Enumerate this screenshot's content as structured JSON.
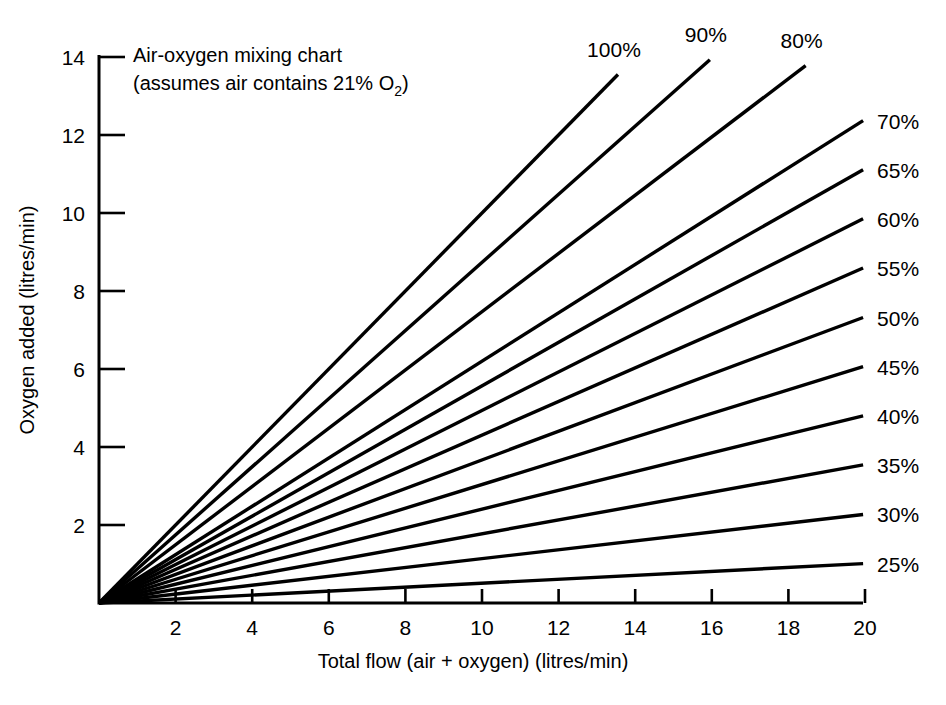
{
  "chart_data": {
    "type": "line",
    "title": "Air-oxygen mixing chart",
    "subtitle_prefix": "(assumes air contains 21% O",
    "subtitle_sub": "2",
    "subtitle_suffix": ")",
    "xlabel": "Total flow (air + oxygen) (litres/min)",
    "ylabel": "Oxygen added (litres/min)",
    "xlim": [
      0,
      20
    ],
    "ylim": [
      0,
      14
    ],
    "xticks": [
      2,
      4,
      6,
      8,
      10,
      12,
      14,
      16,
      18,
      20
    ],
    "yticks": [
      2,
      4,
      6,
      8,
      10,
      12,
      14
    ],
    "xtick_labels": [
      "2",
      "4",
      "6",
      "8",
      "10",
      "12",
      "14",
      "16",
      "18",
      "20"
    ],
    "ytick_labels": [
      "2",
      "4",
      "6",
      "8",
      "10",
      "12",
      "14"
    ],
    "grid": false,
    "legend_position": "inline-right-end-of-line",
    "line_color": "#000000",
    "background_color": "#ffffff",
    "series": [
      {
        "name": "100%",
        "label": "100%",
        "fio2_percent": 100,
        "slope": 1.0,
        "x_start": 0,
        "y_start": 0,
        "x_end": 13.55,
        "y_end": 13.55,
        "label_anchor": "above"
      },
      {
        "name": "90%",
        "label": "90%",
        "fio2_percent": 90,
        "slope": 0.8734,
        "x_start": 0,
        "y_start": 0,
        "x_end": 15.95,
        "y_end": 13.93,
        "label_anchor": "above"
      },
      {
        "name": "80%",
        "label": "80%",
        "fio2_percent": 80,
        "slope": 0.7468,
        "x_start": 0,
        "y_start": 0,
        "x_end": 18.45,
        "y_end": 13.78,
        "label_anchor": "above"
      },
      {
        "name": "70%",
        "label": "70%",
        "fio2_percent": 70,
        "slope": 0.6203,
        "x_start": 0,
        "y_start": 0,
        "x_end": 19.95,
        "y_end": 12.37,
        "label_anchor": "right"
      },
      {
        "name": "65%",
        "label": "65%",
        "fio2_percent": 65,
        "slope": 0.557,
        "x_start": 0,
        "y_start": 0,
        "x_end": 19.95,
        "y_end": 11.11,
        "label_anchor": "right"
      },
      {
        "name": "60%",
        "label": "60%",
        "fio2_percent": 60,
        "slope": 0.4937,
        "x_start": 0,
        "y_start": 0,
        "x_end": 19.95,
        "y_end": 9.85,
        "label_anchor": "right"
      },
      {
        "name": "55%",
        "label": "55%",
        "fio2_percent": 55,
        "slope": 0.4304,
        "x_start": 0,
        "y_start": 0,
        "x_end": 19.95,
        "y_end": 8.59,
        "label_anchor": "right"
      },
      {
        "name": "50%",
        "label": "50%",
        "fio2_percent": 50,
        "slope": 0.3671,
        "x_start": 0,
        "y_start": 0,
        "x_end": 19.95,
        "y_end": 7.32,
        "label_anchor": "right"
      },
      {
        "name": "45%",
        "label": "45%",
        "fio2_percent": 45,
        "slope": 0.3038,
        "x_start": 0,
        "y_start": 0,
        "x_end": 19.95,
        "y_end": 6.06,
        "label_anchor": "right"
      },
      {
        "name": "40%",
        "label": "40%",
        "fio2_percent": 40,
        "slope": 0.2405,
        "x_start": 0,
        "y_start": 0,
        "x_end": 19.95,
        "y_end": 4.8,
        "label_anchor": "right"
      },
      {
        "name": "35%",
        "label": "35%",
        "fio2_percent": 35,
        "slope": 0.1772,
        "x_start": 0,
        "y_start": 0,
        "x_end": 19.95,
        "y_end": 3.54,
        "label_anchor": "right"
      },
      {
        "name": "30%",
        "label": "30%",
        "fio2_percent": 30,
        "slope": 0.1139,
        "x_start": 0,
        "y_start": 0,
        "x_end": 19.95,
        "y_end": 2.27,
        "label_anchor": "right"
      },
      {
        "name": "25%",
        "label": "25%",
        "fio2_percent": 25,
        "slope": 0.0506,
        "x_start": 0,
        "y_start": 0,
        "x_end": 19.95,
        "y_end": 1.01,
        "label_anchor": "right"
      }
    ]
  },
  "geometry": {
    "origin_x_px": 99,
    "origin_y_px": 603,
    "px_per_x_unit": 38.3,
    "px_per_y_unit": 39.0,
    "y_axis_top_px": 55,
    "x_axis_right_px": 863,
    "tick_length_px": 14
  }
}
